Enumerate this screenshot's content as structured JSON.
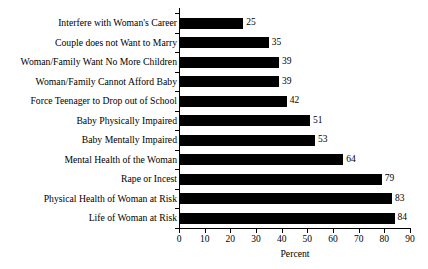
{
  "chart_data": {
    "type": "bar",
    "orientation": "horizontal",
    "title": "",
    "xlabel": "Percent",
    "ylabel": "",
    "xlim": [
      0,
      90
    ],
    "xticks": [
      0,
      10,
      20,
      30,
      40,
      50,
      60,
      70,
      80,
      90
    ],
    "grid": false,
    "legend": false,
    "bar_color": "#000000",
    "categories": [
      "Interfere with Woman's Career",
      "Couple does not Want to Marry",
      "Woman/Family Want No More Children",
      "Woman/Family Cannot Afford Baby",
      "Force Teenager to Drop out of School",
      "Baby Physically Impaired",
      "Baby Mentally Impaired",
      "Mental Health of the Woman",
      "Rape or Incest",
      "Physical Health of Woman at Risk",
      "Life of Woman at Risk"
    ],
    "values": [
      25,
      35,
      39,
      39,
      42,
      51,
      53,
      64,
      79,
      83,
      84
    ],
    "value_labels": [
      "25",
      "35",
      "39",
      "39",
      "42",
      "51",
      "53",
      "64",
      "79",
      "83",
      "84"
    ]
  }
}
